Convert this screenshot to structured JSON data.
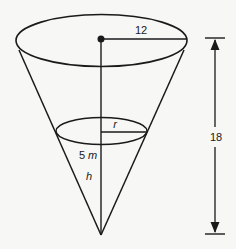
{
  "figure": {
    "type": "inverted-cone-diagram",
    "labels": {
      "top_radius": "12",
      "height": "18",
      "water_radius": "r",
      "water_depth_number": "5",
      "water_depth_unit": "m",
      "water_depth_var": "h"
    },
    "colors": {
      "stroke": "#1a1a1a",
      "background": "#f7f7f5"
    }
  }
}
